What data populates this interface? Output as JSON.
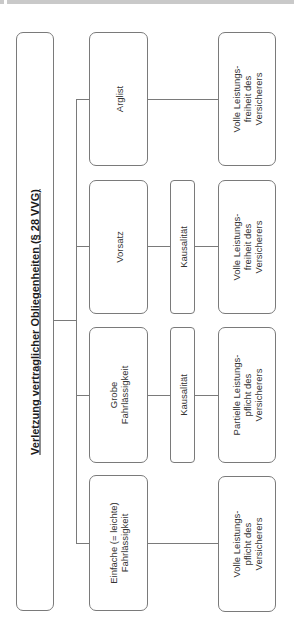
{
  "diagram": {
    "title": "Verletzung vertraglicher Obliegenheiten (§ 28 VVG)",
    "levels": [
      {
        "fault": [
          "Einfache (= leichte)",
          "Fahrlässigkeit"
        ],
        "causality": null,
        "consequence": [
          "Volle Leistungs-",
          "pflicht des",
          "Versicherers"
        ]
      },
      {
        "fault": [
          "Grobe",
          "Fahrlässigkeit"
        ],
        "causality": "Kausalität",
        "consequence": [
          "Partielle Leistungs-",
          "pflicht des",
          "Versicherers"
        ]
      },
      {
        "fault": [
          "Vorsatz"
        ],
        "causality": "Kausalität",
        "consequence": [
          "Volle Leistungs-",
          "freiheit des",
          "Versicherers"
        ]
      },
      {
        "fault": [
          "Arglist"
        ],
        "causality": null,
        "consequence": [
          "Volle Leistungs-",
          "freiheit des",
          "Versicherers"
        ]
      }
    ]
  },
  "colors": {
    "line": "#7a7a7a",
    "top_bar": "#c9c9c9",
    "text": "#333333"
  }
}
